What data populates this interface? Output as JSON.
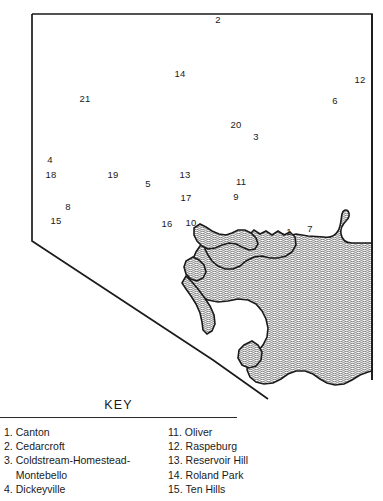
{
  "map": {
    "title": "Baltimore City Neighborhoods Map",
    "colors": {
      "outline": "#1a1a1a",
      "water_fill": "#cfcfcf",
      "land_fill": "#ffffff",
      "text": "#1a1a1a"
    },
    "markers": [
      {
        "id": "2",
        "label": "2",
        "x": 218,
        "y": 20
      },
      {
        "id": "14",
        "label": "14",
        "x": 180,
        "y": 74
      },
      {
        "id": "12",
        "label": "12",
        "x": 360,
        "y": 80
      },
      {
        "id": "21",
        "label": "21",
        "x": 85,
        "y": 99
      },
      {
        "id": "6",
        "label": "6",
        "x": 335,
        "y": 101
      },
      {
        "id": "20",
        "label": "20",
        "x": 236,
        "y": 125
      },
      {
        "id": "3",
        "label": "3",
        "x": 256,
        "y": 137
      },
      {
        "id": "4",
        "label": "4",
        "x": 50,
        "y": 160
      },
      {
        "id": "18",
        "label": "18",
        "x": 51,
        "y": 175
      },
      {
        "id": "19",
        "label": "19",
        "x": 113,
        "y": 175
      },
      {
        "id": "13",
        "label": "13",
        "x": 185,
        "y": 175
      },
      {
        "id": "11",
        "label": "11",
        "x": 241,
        "y": 182
      },
      {
        "id": "5",
        "label": "5",
        "x": 148,
        "y": 184
      },
      {
        "id": "17",
        "label": "17",
        "x": 186,
        "y": 198
      },
      {
        "id": "9",
        "label": "9",
        "x": 236,
        "y": 197
      },
      {
        "id": "8",
        "label": "8",
        "x": 68,
        "y": 207
      },
      {
        "id": "15",
        "label": "15",
        "x": 56,
        "y": 221
      },
      {
        "id": "16",
        "label": "16",
        "x": 167,
        "y": 224
      },
      {
        "id": "10",
        "label": "10",
        "x": 191,
        "y": 223
      },
      {
        "id": "1",
        "label": "1",
        "x": 289,
        "y": 232
      },
      {
        "id": "7",
        "label": "7",
        "x": 310,
        "y": 229
      }
    ]
  },
  "key": {
    "title": "KEY",
    "left_column": [
      {
        "num": "1.",
        "name": "Canton"
      },
      {
        "num": "2.",
        "name": "Cedarcroft"
      },
      {
        "num": "3.",
        "name": "Coldstream-Homestead-Montebello",
        "wrap": true
      },
      {
        "num": "4.",
        "name": "Dickeyville"
      }
    ],
    "right_column": [
      {
        "num": "11.",
        "name": "Oliver"
      },
      {
        "num": "12.",
        "name": "Raspeburg"
      },
      {
        "num": "13.",
        "name": "Reservoir Hill"
      },
      {
        "num": "14.",
        "name": "Roland Park"
      },
      {
        "num": "15.",
        "name": "Ten Hills"
      }
    ]
  }
}
